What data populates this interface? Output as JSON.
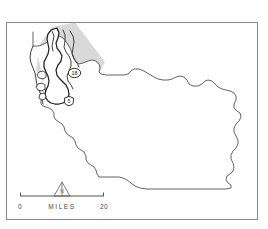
{
  "figure": {
    "kind": "reference-locator-map",
    "background_color": "#ffffff",
    "frame": {
      "stroke_color": "#8a8a8a",
      "x": 6,
      "y": 22,
      "width": 252,
      "height": 198
    }
  },
  "map": {
    "outline_color": "#3c3c3c",
    "coast_color": "#1e1e1e",
    "fill_color": "#ffffff",
    "region_label": "",
    "shaded_overlay": {
      "name": "study-area-wedge",
      "color": "#b9b9b9",
      "opacity": 0.55,
      "description": "light gray triangular wedge over northwest coastal sector"
    }
  },
  "markers": [
    {
      "id": "marker-18",
      "shape": "oval",
      "label": "18",
      "x": 74.5,
      "y": 73.0,
      "rx": 6.2,
      "ry": 4.6
    },
    {
      "id": "marker-5",
      "shape": "shield",
      "label": "5",
      "x": 69.0,
      "y": 101.0,
      "rx": 4.6,
      "ry": 4.8
    }
  ],
  "scale_bar": {
    "name": "scale-bar",
    "min_label": "0",
    "max_label": "20",
    "units_label": "MILES",
    "bar_x1": 20,
    "bar_x2": 104,
    "bar_y": 196,
    "tick_height": 4,
    "label_y": 208,
    "color": "#555555"
  },
  "north_arrow": {
    "name": "north-arrow",
    "label": "N",
    "x": 62,
    "apex_y": 182,
    "base_y": 196,
    "half_width": 8,
    "color": "#6a6a6a"
  }
}
